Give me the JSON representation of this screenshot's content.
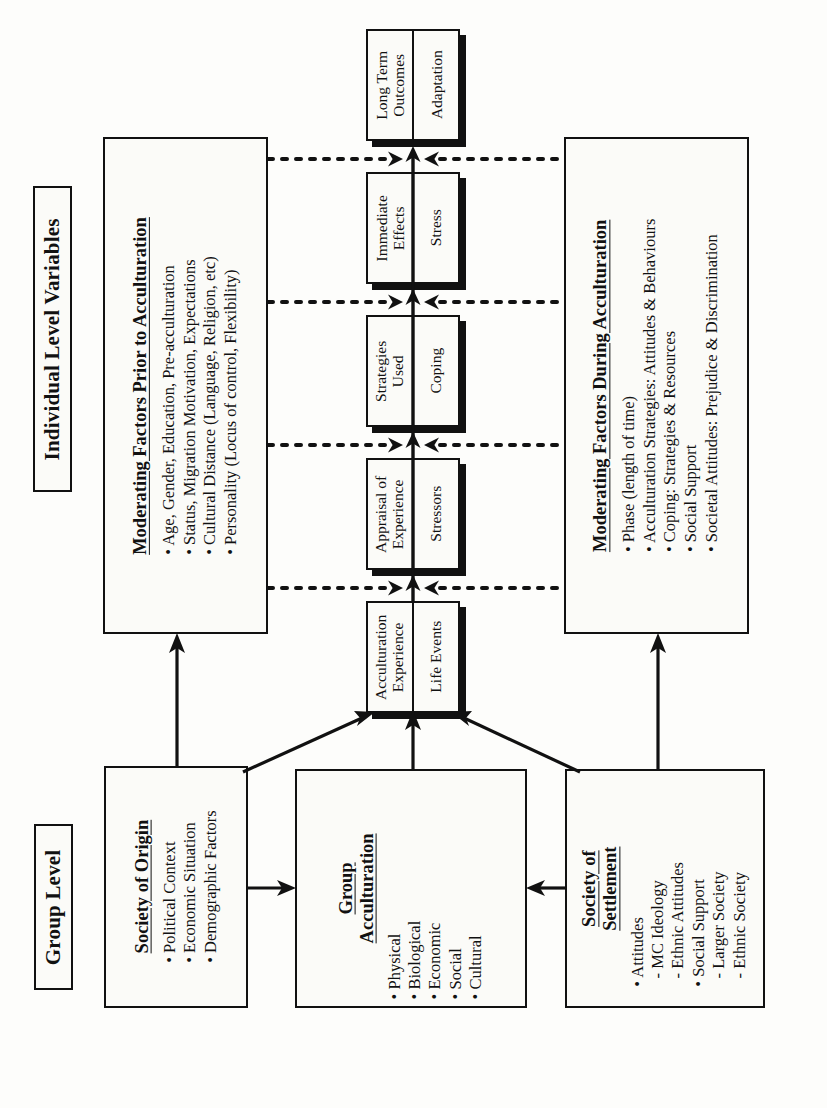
{
  "diagram": {
    "title_individual_level": "Individual Level Variables",
    "title_group_level": "Group Level",
    "moderating_prior": {
      "title": "Moderating Factors Prior to Acculturation",
      "items": [
        "• Age, Gender, Education, Pre-acculturation",
        "• Status, Migration Motivation, Expectations",
        "• Cultural Distance (Language, Religion, etc)",
        "• Personality (Locus of control, Flexibility)"
      ]
    },
    "moderating_during": {
      "title": "Moderating Factors During Acculturation",
      "items": [
        "• Phase (length of time)",
        "• Acculturation Strategies:  Attitudes & Behaviours",
        "• Coping:  Strategies & Resources",
        "• Social Support",
        "• Societal Attitudes:  Prejudice & Discrimination"
      ]
    },
    "chain": [
      {
        "upper": "Acculturation\nExperience",
        "lower": "Life Events"
      },
      {
        "upper": "Appraisal of\nExperience",
        "lower": "Stressors"
      },
      {
        "upper": "Strategies\nUsed",
        "lower": "Coping"
      },
      {
        "upper": "Immediate\nEffects",
        "lower": "Stress"
      },
      {
        "upper": "Long Term\nOutcomes",
        "lower": "Adaptation"
      }
    ],
    "society_of_origin": {
      "title": "Society of Origin",
      "items": [
        "• Political Context",
        "• Economic Situation",
        "• Demographic Factors"
      ]
    },
    "group_acculturation": {
      "title": "Group\nAcculturation",
      "items": [
        "• Physical",
        "• Biological",
        "• Economic",
        "• Social",
        "• Cultural"
      ]
    },
    "society_of_settlement": {
      "title": "Society of\nSettlement",
      "items": [
        "• Attitudes",
        "  - MC Ideology",
        "  - Ethnic Attitudes",
        "• Social Support",
        "  - Larger Society",
        "  - Ethnic Society"
      ]
    },
    "colors": {
      "ink": "#111111",
      "paper": "#fdfdfb",
      "box_fill": "#fbfbf8"
    }
  }
}
